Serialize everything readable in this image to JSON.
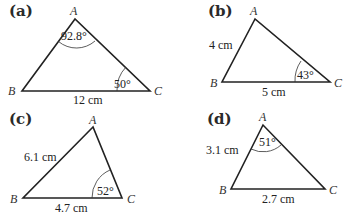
{
  "figures": [
    {
      "label": "(a)",
      "vertices": {
        "A": "A",
        "B": "B",
        "C": "C"
      },
      "side_label": "12 cm",
      "angle_A": "92.8°",
      "angle_C": "50°"
    },
    {
      "label": "(b)",
      "vertices": {
        "A": "A",
        "B": "B",
        "C": "C"
      },
      "side_AB": "4 cm",
      "side_BC": "5 cm",
      "angle_C": "43°"
    },
    {
      "label": "(c)",
      "vertices": {
        "A": "A",
        "B": "B",
        "C": "C"
      },
      "side_AB": "6.1 cm",
      "side_BC": "4.7 cm",
      "angle_C": "52°"
    },
    {
      "label": "(d)",
      "vertices": {
        "A": "A",
        "B": "B",
        "C": "C"
      },
      "side_AB": "3.1 cm",
      "side_BC": "2.7 cm",
      "angle_A": "51°"
    }
  ]
}
